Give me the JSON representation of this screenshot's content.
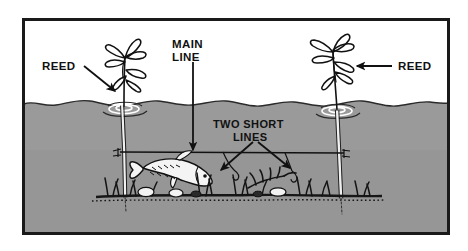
{
  "figure": {
    "medium": "black and white line illustration",
    "frame": {
      "border_color": "#1a1a1a",
      "border_width_px": 3,
      "x": 22,
      "y": 18,
      "width": 428,
      "height": 217
    },
    "colors": {
      "ink": "#111111",
      "water": "#9a9a9a",
      "water_dark": "#8d8d8d",
      "air": "#ffffff",
      "fish_body": "#f2f2f2",
      "paper": "#ffffff",
      "bed": "#1a1a1a"
    },
    "scene": {
      "air_region_label": "above water",
      "water_region_label": "below water",
      "waterline_y": 103,
      "bed_y": 196
    },
    "labels": [
      {
        "id": "reed-left",
        "text": "REED",
        "x": 42,
        "y": 70,
        "anchor": "start",
        "arrow": {
          "from": [
            84,
            67
          ],
          "to": [
            117,
            93
          ],
          "direction": "down-right"
        }
      },
      {
        "id": "main-line",
        "text_line_1": "MAIN",
        "text_line_2": "LINE",
        "x": 172,
        "y": 48,
        "anchor": "start",
        "arrow": {
          "from": [
            193,
            60
          ],
          "to": [
            193,
            152
          ],
          "direction": "down"
        }
      },
      {
        "id": "two-short-lines",
        "text_line_1": "TWO SHORT",
        "text_line_2": "LINES",
        "x": 213,
        "y": 128,
        "anchor": "start",
        "arrows": [
          {
            "from": [
              252,
              143
            ],
            "to": [
              219,
              172
            ],
            "direction": "down-left"
          },
          {
            "from": [
              258,
              143
            ],
            "to": [
              292,
              170
            ],
            "direction": "down-right"
          }
        ]
      },
      {
        "id": "reed-right",
        "text": "REED",
        "x": 396,
        "y": 70,
        "anchor": "start",
        "arrow": {
          "from": [
            392,
            66
          ],
          "to": [
            355,
            66
          ],
          "direction": "left"
        }
      }
    ],
    "elements": [
      {
        "id": "reed-left-plant",
        "name": "reed plant (left)",
        "stem_x": 124,
        "top_y": 32
      },
      {
        "id": "reed-right-plant",
        "name": "reed plant (right)",
        "stem_x": 335,
        "top_y": 26
      },
      {
        "id": "main-line-rig",
        "name": "main line strung between reed stems",
        "y": 152,
        "x1": 120,
        "x2": 345
      },
      {
        "id": "short-line-left",
        "name": "short dropper line with hook (left)"
      },
      {
        "id": "short-line-right",
        "name": "short dropper line with hook (right)"
      },
      {
        "id": "fish",
        "name": "fish swimming right",
        "x": 140,
        "y": 168
      },
      {
        "id": "lake-bed",
        "name": "weedy lake bed with grass tufts and stones"
      },
      {
        "id": "ripples-left",
        "name": "surface ripples around left reed stem",
        "cx": 124,
        "cy": 108
      },
      {
        "id": "ripples-right",
        "name": "surface ripples around right reed stem",
        "cx": 337,
        "cy": 110
      }
    ]
  }
}
